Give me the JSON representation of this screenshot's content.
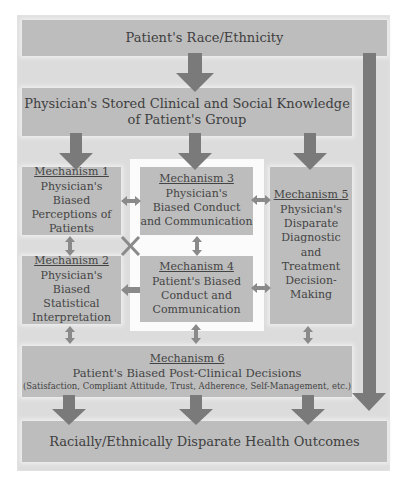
{
  "top": {
    "label": "Patient's Race/Ethnicity"
  },
  "knowledge": {
    "line1": "Physician's Stored Clinical and Social Knowledge",
    "line2": "of Patient's Group"
  },
  "mech1": {
    "title": "Mechanism 1",
    "lines": [
      "Physician's Biased",
      "Perceptions of",
      "Patients"
    ]
  },
  "mech2": {
    "title": "Mechanism 2",
    "lines": [
      "Physician's Biased",
      "Statistical",
      "Interpretation"
    ]
  },
  "mech3": {
    "title": "Mechanism 3",
    "lines": [
      "Physician's",
      "Biased Conduct",
      "and Communication"
    ]
  },
  "mech4": {
    "title": "Mechanism 4",
    "lines": [
      "Patient's Biased",
      "Conduct and",
      "Communication"
    ]
  },
  "mech5": {
    "title": "Mechanism 5",
    "lines": [
      "Physician's",
      "Disparate",
      "Diagnostic",
      "and",
      "Treatment",
      "Decision-",
      "Making"
    ]
  },
  "mech6": {
    "title": "Mechanism 6",
    "line1": "Patient's Biased Post-Clinical Decisions",
    "line2": "(Satisfaction, Compliant Attitude, Trust, Adherence, Self-Management, etc.)"
  },
  "outcome": {
    "label": "Racially/Ethnically Disparate Health Outcomes"
  },
  "colors": {
    "frame": "#dcdcdc",
    "box": "#bdbdbd",
    "arrow": "#7a7a7a",
    "highlight": "#fbfbfb"
  }
}
